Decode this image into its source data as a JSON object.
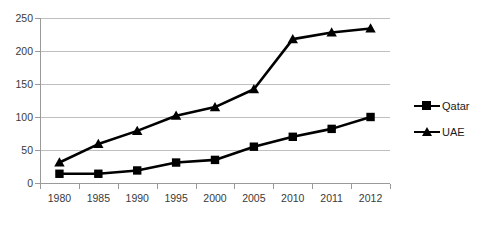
{
  "chart_data": {
    "type": "line",
    "title": "",
    "xlabel": "",
    "ylabel": "",
    "categories": [
      "1980",
      "1985",
      "1990",
      "1995",
      "2000",
      "2005",
      "2010",
      "2011",
      "2012"
    ],
    "series": [
      {
        "name": "Qatar",
        "marker": "square",
        "color": "#000000",
        "values": [
          14,
          14,
          19,
          31,
          35,
          55,
          70,
          82,
          100
        ]
      },
      {
        "name": "UAE",
        "marker": "triangle",
        "color": "#000000",
        "values": [
          31,
          59,
          79,
          102,
          115,
          142,
          218,
          228,
          234
        ]
      }
    ],
    "ylim": [
      0,
      250
    ],
    "yticks": [
      0,
      50,
      100,
      150,
      200,
      250
    ],
    "ytick_labels": [
      "0",
      "50",
      "100",
      "150",
      "200",
      "250"
    ],
    "grid": true,
    "legend_position": "right"
  },
  "legend": {
    "items": [
      {
        "label": "Qatar"
      },
      {
        "label": "UAE"
      }
    ]
  }
}
